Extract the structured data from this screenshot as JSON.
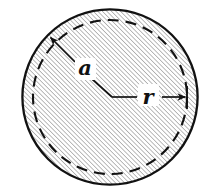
{
  "figure": {
    "name": "hatched-disk-with-radii",
    "background_color": "#ffffff",
    "width": 221,
    "height": 196
  },
  "colors": {
    "stroke": "#121212",
    "hatch": "#8a8a8a",
    "fill": "#ffffff",
    "label": "#121212"
  },
  "shapes": {
    "outer_circle": {
      "name": "outer-circle",
      "cx": 110,
      "cy": 97,
      "r": 88,
      "style": "solid",
      "stroke_width": 2.2,
      "fill": "diagonal-hatch-45"
    },
    "inner_circle": {
      "name": "inner-dashed-circle",
      "cx": 110,
      "cy": 97,
      "r": 77,
      "style": "dashed",
      "stroke_width": 2.0,
      "dash_pattern": "11 7"
    }
  },
  "hatching": {
    "angle_degrees": 45,
    "direction": "lower-left to upper-right",
    "spacing_px": 3.2,
    "line_width": 1.0,
    "color": "#8a8a8a"
  },
  "annotations": [
    {
      "id": "radius-a",
      "label": "a",
      "label_x": 85,
      "label_y": 74,
      "font_size": 20,
      "leader": {
        "from_x": 75,
        "from_y": 63,
        "to_x": 48,
        "to_y": 36,
        "arrowhead": "at-tip",
        "points_to": "outer-circle"
      }
    },
    {
      "id": "radius-r",
      "label": "r",
      "label_x": 144,
      "label_y": 105,
      "font_size": 20,
      "leader": {
        "from_x": 112,
        "from_y": 97,
        "to_x": 185,
        "to_y": 97,
        "arrowhead": "at-tip",
        "points_to": "inner-dashed-circle",
        "end_tick": {
          "x": 187,
          "y_top": 86,
          "y_bottom": 109
        }
      }
    }
  ],
  "center_marker": {
    "name": "center-bend-point",
    "x": 112,
    "y": 97,
    "leader_from_label_x": 92,
    "leader_from_label_y": 79
  }
}
